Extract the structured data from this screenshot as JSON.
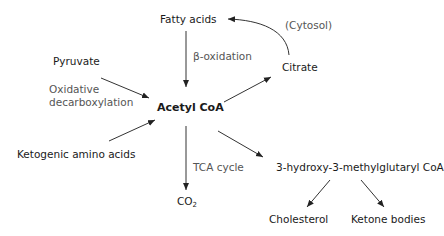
{
  "nodes": {
    "fatty_acids": "Fatty acids",
    "pyruvate": "Pyruvate",
    "acetyl_coa": "Acetyl CoA",
    "citrate": "Citrate",
    "ketogenic": "Ketogenic amino acids",
    "co2": "CO",
    "co2_sub": "2",
    "hmg_coa": "3-hydroxy-3-methylglutaryl CoA",
    "cholesterol": "Cholesterol",
    "ketone_bodies": "Ketone bodies"
  },
  "edge_labels": {
    "beta_oxidation": "β-oxidation",
    "oxidative_line1": "Oxidative",
    "oxidative_line2": "decarboxylation",
    "cytosol": "(Cytosol)",
    "tca_cycle": "TCA cycle"
  },
  "colors": {
    "text": "#1a1a1a",
    "note": "#555555",
    "arrow": "#222222"
  }
}
